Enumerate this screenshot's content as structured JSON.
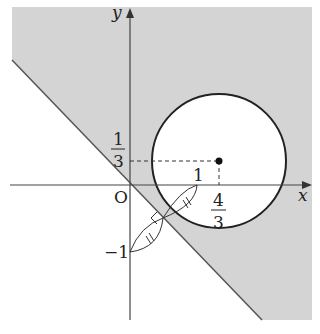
{
  "diagram": {
    "axes": {
      "x_label": "x",
      "y_label": "y",
      "origin_label": "O"
    },
    "labels": {
      "one_x": "1",
      "minus_one_y": "−1",
      "frac_1_3_num": "1",
      "frac_1_3_den": "3",
      "frac_4_3_num": "4",
      "frac_4_3_den": "3"
    },
    "circle": {
      "center": "(4/3, 1/3)",
      "radius": "1"
    },
    "line": "y = -x",
    "shaded_region": "above line y = -x, outside circle",
    "colors": {
      "shade": "#d4d4d4",
      "stroke": "#222222"
    }
  }
}
